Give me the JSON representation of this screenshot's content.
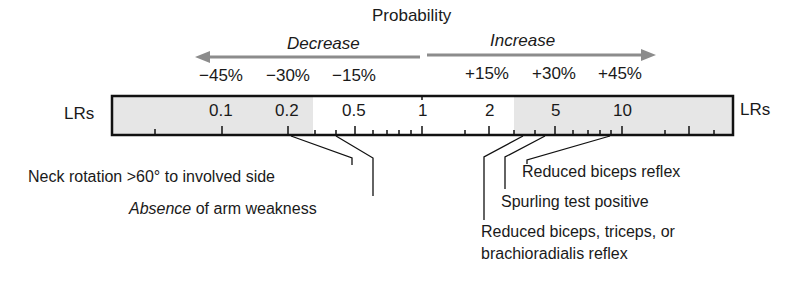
{
  "title": "Probability",
  "direction": {
    "decrease": "Decrease",
    "increase": "Increase",
    "arrow_color": "#8c8c8c"
  },
  "percent_labels": {
    "negative": [
      "−45%",
      "−30%",
      "−15%"
    ],
    "positive": [
      "+15%",
      "+30%",
      "+45%"
    ]
  },
  "scale": {
    "left_label": "LRs",
    "right_label": "LRs",
    "ticks": [
      "0.1",
      "0.2",
      "0.5",
      "1",
      "2",
      "5",
      "10"
    ],
    "shade_color": "#e6e6e6",
    "border_color": "#111111"
  },
  "findings": {
    "neck_rotation": "Neck rotation >60° to involved side",
    "absence_italic": "Absence",
    "absence_rest": " of arm weakness",
    "reduced_biceps": "Reduced biceps reflex",
    "spurling": "Spurling test positive",
    "reduced_multi_line1": "Reduced biceps, triceps, or",
    "reduced_multi_line2": "brachioradialis reflex"
  }
}
